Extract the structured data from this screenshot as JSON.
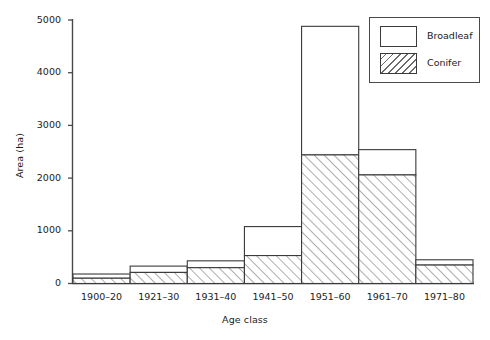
{
  "chart_data": {
    "type": "bar",
    "title": "",
    "subtitle": "",
    "xlabel": "Age class",
    "ylabel": "Area (ha)",
    "categories": [
      "1900–20",
      "1921–30",
      "1931–40",
      "1941–50",
      "1951–60",
      "1961–70",
      "1971–80"
    ],
    "stacked": true,
    "series": [
      {
        "name": "Conifer",
        "fill": "diagonal-hatch",
        "values": [
          100,
          210,
          300,
          530,
          2440,
          2060,
          350
        ]
      },
      {
        "name": "Broadleaf",
        "fill": "white",
        "values": [
          80,
          120,
          130,
          550,
          2440,
          480,
          100
        ]
      }
    ],
    "totals": [
      180,
      330,
      430,
      1080,
      4880,
      2540,
      450
    ],
    "ylim": [
      0,
      5000
    ],
    "yticks": [
      0,
      1000,
      2000,
      3000,
      4000,
      5000
    ],
    "ytick_labels": [
      "0",
      "1000",
      "2000",
      "3000",
      "4000",
      "5000"
    ],
    "grid": false,
    "legend_position": "top-right",
    "legend_entries": [
      "Broadleaf",
      "Conifer"
    ],
    "axis_color": "#4a4a4a",
    "bar_edge_color": "#3a3a3a",
    "hatch_color": "#6a6a6a"
  },
  "legend": {
    "items": [
      {
        "label": "Broadleaf",
        "fill": "white"
      },
      {
        "label": "Conifer",
        "fill": "diagonal-hatch"
      }
    ]
  }
}
